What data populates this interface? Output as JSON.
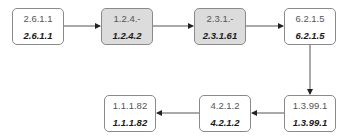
{
  "diagram": {
    "type": "enzyme-pathway",
    "colors": {
      "shaded_fill": "#dcdcdc",
      "border": "#8a8a8a",
      "edge": "#444444"
    },
    "nodes": [
      {
        "id": "n1",
        "top": "2.6.1.1",
        "bottom": "2.6.1.1",
        "shaded": false
      },
      {
        "id": "n2",
        "top": "1.2.4.-",
        "bottom": "1.2.4.2",
        "shaded": true
      },
      {
        "id": "n3",
        "top": "2.3.1.-",
        "bottom": "2.3.1.61",
        "shaded": true
      },
      {
        "id": "n4",
        "top": "6.2.1.5",
        "bottom": "6.2.1.5",
        "shaded": false
      },
      {
        "id": "n5",
        "top": "1.3.99.1",
        "bottom": "1.3.99.1",
        "shaded": false
      },
      {
        "id": "n6",
        "top": "4.2.1.2",
        "bottom": "4.2.1.2",
        "shaded": false
      },
      {
        "id": "n7",
        "top": "1.1.1.82",
        "bottom": "1.1.1.82",
        "shaded": false
      }
    ],
    "edges": [
      {
        "from": "n1",
        "to": "n2"
      },
      {
        "from": "n2",
        "to": "n3"
      },
      {
        "from": "n3",
        "to": "n4"
      },
      {
        "from": "n4",
        "to": "n5"
      },
      {
        "from": "n5",
        "to": "n6"
      },
      {
        "from": "n6",
        "to": "n7"
      }
    ]
  }
}
